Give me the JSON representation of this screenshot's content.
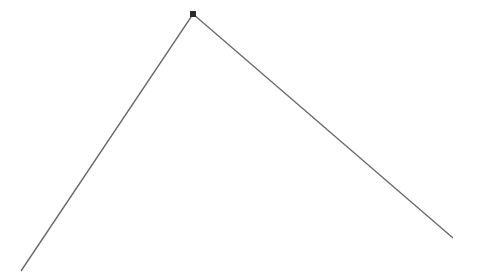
{
  "diagram": {
    "background": "#ffffff",
    "stroke_color": "#6b6b6b",
    "marker_color": "#2b2b2b",
    "polyline": [
      [
        21,
        271
      ],
      [
        193,
        14
      ],
      [
        453,
        238
      ]
    ],
    "vertex": {
      "x": 193,
      "y": 14,
      "size": 6
    }
  }
}
